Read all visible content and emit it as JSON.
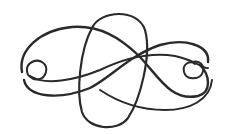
{
  "image": {
    "subject": "decorative calligraphic flourish ornament",
    "background": "#ffffff",
    "stroke_color": "#2a2a2a"
  }
}
